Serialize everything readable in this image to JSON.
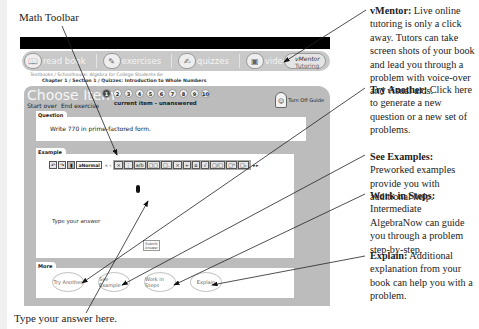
{
  "figure": {
    "label_toolbar": "Math Toolbar",
    "label_answer": "Type your answer here."
  },
  "callouts": [
    {
      "title": "vMentor:",
      "text": " Live online tutoring is only a click away. Tutors can take screen shots of your book and lead you through a problem with voice-over and visual aids."
    },
    {
      "title": "Try Another:",
      "text": " Click here to generate a new question or a new set of problems."
    },
    {
      "title": "See Examples:",
      "text": " Preworked examples provide you with additional help."
    },
    {
      "title": "Work in Steps:",
      "text": " Intermediate AlgebraNow can guide you through a problem step-by-step."
    },
    {
      "title": "Explain:",
      "text": " Additional explanation from your book can help you with a problem."
    }
  ],
  "nav": {
    "items": [
      {
        "label": "read book",
        "icon": "book-icon"
      },
      {
        "label": "exercises",
        "icon": "pencil-icon"
      },
      {
        "label": "quizzes",
        "icon": "quiz-icon"
      },
      {
        "label": "video",
        "icon": "video-icon"
      }
    ],
    "vmentor_label": "vMentor",
    "vmentor_sub": "Tutoring"
  },
  "breadcrumb": {
    "line1": "Textbooks / Schoolhouse: Algebra for College Students 6e",
    "line2": "Chapter 1 / Section 1 / Quizzes: Introduction to Whole Numbers"
  },
  "panel": {
    "title": "Choose Item",
    "items": [
      "1",
      "2",
      "3",
      "4",
      "5",
      "6",
      "7",
      "8",
      "9",
      "10"
    ],
    "active_item": "1",
    "status": "current item - unanswered",
    "start_over": "Start over",
    "end_exercise": "End exercise",
    "guide_label": "Turn Off Guide"
  },
  "question": {
    "tab": "Question",
    "text": "Write 770 in prime-factored form."
  },
  "example": {
    "tab": "Example",
    "toolbar": {
      "left": [
        "↶",
        "↷",
        "🗑"
      ],
      "format_label": "aNormal",
      "group": [
        "×",
        "÷",
        "a/b",
        "□□",
        "□₋",
        "×",
        "÷",
        "±",
        "√",
        "□/□",
        "□ⁿ",
        "□ₙ"
      ]
    },
    "answer_label": "Type your answer",
    "submit_label": "Submit Answer"
  },
  "more": {
    "tab": "More",
    "buttons": [
      "Try Another",
      "See Example",
      "Work in Steps",
      "Explain"
    ]
  }
}
